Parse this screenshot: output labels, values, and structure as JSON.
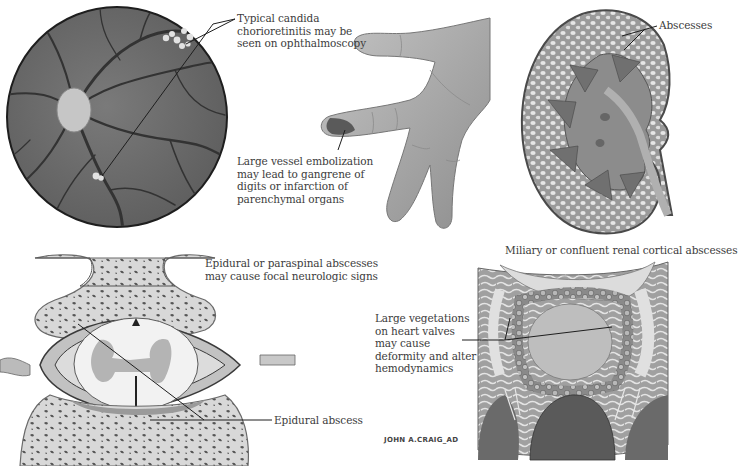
{
  "figure": {
    "colors": {
      "background": "#ffffff",
      "ink": "#3c3c3c",
      "fundus": "#6e6e6e",
      "fundus_vessel": "#3a3a3a",
      "optic_disc": "#c8c8c8",
      "skin": "#a8a8a8",
      "bone": "#dcdcdc",
      "cord": "#f0f0f0",
      "gray_matter": "#b4b4b4"
    },
    "panels": [
      {
        "id": "retina",
        "title_lines": [
          "Typical candida",
          "chorioretinitis may be",
          "seen on ophthalmoscopy"
        ]
      },
      {
        "id": "hand",
        "title_lines": [
          "Large vessel embolization",
          "may lead to gangrene of",
          "digits or infarction of",
          "parenchymal organs"
        ]
      },
      {
        "id": "kidney",
        "callout": "Abscesses",
        "caption": "Miliary or confluent renal cortical abscesses"
      },
      {
        "id": "spine",
        "title_lines": [
          "Epidural or paraspinal abscesses",
          "may cause focal neurologic signs"
        ],
        "callout": "Epidural abscess"
      },
      {
        "id": "heart",
        "title_lines": [
          "Large vegetations",
          "on heart valves",
          "may cause",
          "deformity and alter",
          "hemodynamics"
        ],
        "signature": "JOHN A.CRAIG_AD"
      }
    ]
  }
}
